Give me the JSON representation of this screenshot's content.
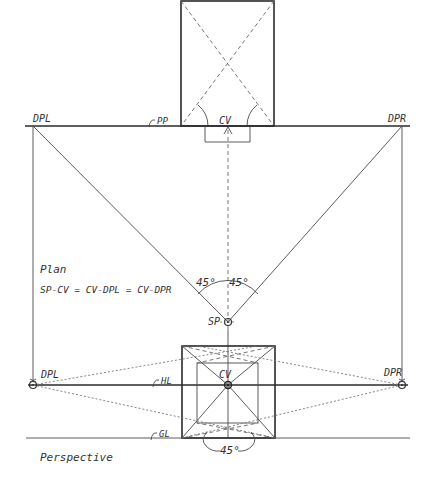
{
  "diagram": {
    "type": "one-point perspective construction",
    "plan": {
      "caption": "Plan",
      "equation": "SP-CV = CV-DPL = CV-DPR",
      "labels": {
        "dpl": "DPL",
        "dpr": "DPR",
        "pp": "PP",
        "cv": "CV",
        "sp": "SP",
        "angle_left": "45°",
        "angle_right": "45°"
      }
    },
    "perspective": {
      "caption": "Perspective",
      "labels": {
        "dpl": "DPL",
        "dpr": "DPR",
        "hl": "HL",
        "cv": "CV",
        "gl": "GL",
        "angle": "45°"
      }
    },
    "colors": {
      "ink": "#333333",
      "background": "#ffffff"
    }
  }
}
